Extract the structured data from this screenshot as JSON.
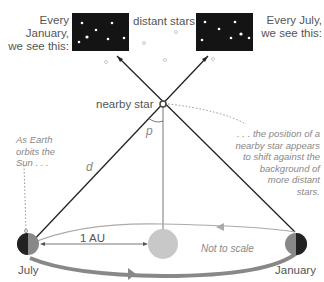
{
  "labels": {
    "january_view": [
      "Every January,",
      "we see this:"
    ],
    "july_view": [
      "Every July,",
      "we see this:"
    ],
    "distant_stars": "distant stars",
    "nearby_star": "nearby star",
    "parallax_angle": "p",
    "distance": "d",
    "earth_orbit_note": [
      "As Earth",
      "orbits the",
      "Sun . . ."
    ],
    "shift_note": [
      ". . . the position of a",
      "nearby star appears",
      "to shift against the",
      "background of",
      "more distant",
      "stars."
    ],
    "au": "1 AU",
    "scale_note": "Not to scale",
    "july": "July",
    "january": "January"
  },
  "colors": {
    "sky": "#1a1a1a",
    "orbit": "#999999",
    "sun": "#c8c8c8",
    "text": "#555555",
    "note": "#888888"
  }
}
